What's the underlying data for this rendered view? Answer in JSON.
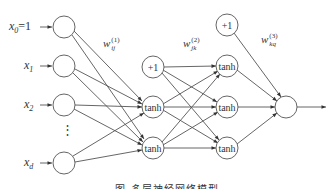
{
  "diagram": {
    "inputs": [
      {
        "label": "x",
        "sub": "0",
        "suffix": "=1"
      },
      {
        "label": "x",
        "sub": "1",
        "suffix": ""
      },
      {
        "label": "x",
        "sub": "2",
        "suffix": ""
      },
      {
        "label": "x",
        "sub": "d",
        "suffix": ""
      }
    ],
    "ellipsis": "⋮",
    "hidden1": {
      "bias": "+1",
      "units": [
        "tanh",
        "tanh"
      ]
    },
    "hidden2": {
      "bias": "+1",
      "units": [
        "tanh",
        "tanh",
        "tanh"
      ]
    },
    "output": {
      "label": ""
    },
    "weights": [
      {
        "base": "w",
        "sub": "ij",
        "sup": "(1)"
      },
      {
        "base": "w",
        "sub": "jk",
        "sup": "(2)"
      },
      {
        "base": "w",
        "sub": "kq",
        "sup": "(3)"
      }
    ],
    "caption": "图      多层神经网络模型",
    "colors": {
      "stroke": "#555555",
      "text": "#333333",
      "background": "#ffffff"
    }
  }
}
